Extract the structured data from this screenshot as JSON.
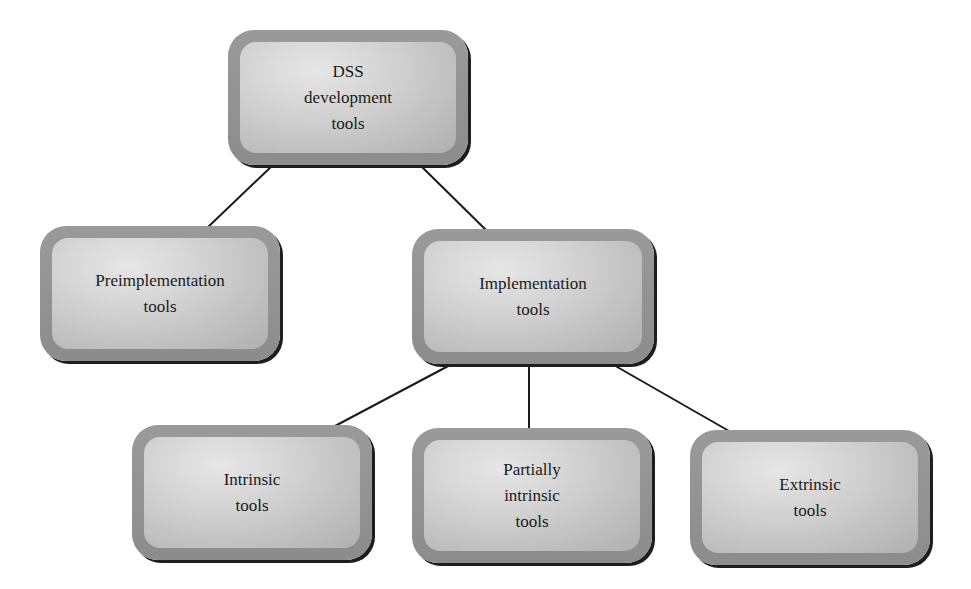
{
  "diagram": {
    "nodes": {
      "root": {
        "lines": [
          "DSS",
          "development",
          "tools"
        ]
      },
      "preimplementation": {
        "lines": [
          "Preimplementation",
          "tools"
        ]
      },
      "implementation": {
        "lines": [
          "Implementation",
          "tools"
        ]
      },
      "intrinsic": {
        "lines": [
          "Intrinsic",
          "tools"
        ]
      },
      "partially_intrinsic": {
        "lines": [
          "Partially",
          "intrinsic",
          "tools"
        ]
      },
      "extrinsic": {
        "lines": [
          "Extrinsic",
          "tools"
        ]
      }
    },
    "edges": [
      {
        "from": "root",
        "to": "preimplementation"
      },
      {
        "from": "root",
        "to": "implementation"
      },
      {
        "from": "implementation",
        "to": "intrinsic"
      },
      {
        "from": "implementation",
        "to": "partially_intrinsic"
      },
      {
        "from": "implementation",
        "to": "extrinsic"
      }
    ],
    "colors": {
      "box_border": "#8f8f8f",
      "box_fill": "#cfcfcf",
      "shadow": "#1e1e1e",
      "line": "#1a1a1a",
      "text": "#1a1a1a"
    }
  }
}
